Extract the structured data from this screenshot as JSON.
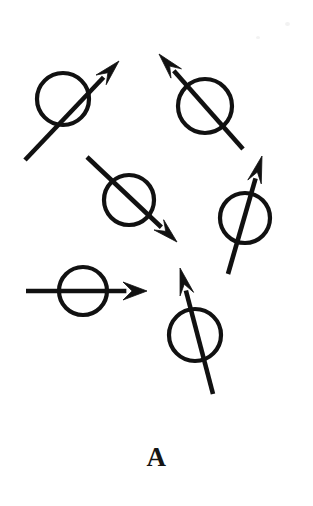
{
  "figure": {
    "title": "A",
    "panel_label": "A",
    "canvas": {
      "width": 313,
      "height": 506
    },
    "colors": {
      "background": "#ffffff",
      "ink": "#111111",
      "label": "#151515"
    },
    "style": {
      "circle_stroke_width": 4.2,
      "arrow_shaft_width": 4.6,
      "circle_fill": "none"
    },
    "spins": [
      {
        "id": "spin-top-left",
        "name": "spin-up-right-top-left",
        "circle": {
          "cx": 63,
          "cy": 99,
          "r": 26
        },
        "arrow": {
          "x1": 25,
          "y1": 160,
          "x2": 119,
          "y2": 61
        },
        "head": {
          "length": 26,
          "half_width": 7
        },
        "angle_deg": 46,
        "direction": "up-right"
      },
      {
        "id": "spin-top-right",
        "name": "spin-up-left-top-right",
        "circle": {
          "cx": 205,
          "cy": 106,
          "r": 27
        },
        "arrow": {
          "x1": 243,
          "y1": 149,
          "x2": 159,
          "y2": 54
        },
        "head": {
          "length": 26,
          "half_width": 7
        },
        "angle_deg": 131,
        "direction": "up-left"
      },
      {
        "id": "spin-middle",
        "name": "spin-down-right-middle",
        "circle": {
          "cx": 129,
          "cy": 200,
          "r": 25
        },
        "arrow": {
          "x1": 87,
          "y1": 157,
          "x2": 177,
          "y2": 242
        },
        "head": {
          "length": 25,
          "half_width": 7
        },
        "angle_deg": -43,
        "direction": "down-right"
      },
      {
        "id": "spin-right",
        "name": "spin-up-right-right",
        "circle": {
          "cx": 245,
          "cy": 218,
          "r": 25
        },
        "arrow": {
          "x1": 228,
          "y1": 274,
          "x2": 262,
          "y2": 156
        },
        "head": {
          "length": 27,
          "half_width": 7
        },
        "angle_deg": 74,
        "direction": "up-steep-right"
      },
      {
        "id": "spin-left-horizontal",
        "name": "spin-right-horizontal-left",
        "circle": {
          "cx": 83,
          "cy": 291,
          "r": 24
        },
        "arrow": {
          "x1": 26,
          "y1": 291,
          "x2": 147,
          "y2": 291
        },
        "head": {
          "length": 24,
          "half_width": 9
        },
        "angle_deg": 0,
        "direction": "right"
      },
      {
        "id": "spin-bottom",
        "name": "spin-up-left-bottom",
        "circle": {
          "cx": 195,
          "cy": 335,
          "r": 26
        },
        "arrow": {
          "x1": 213,
          "y1": 394,
          "x2": 180,
          "y2": 268
        },
        "head": {
          "length": 27,
          "half_width": 7
        },
        "angle_deg": 104,
        "direction": "up-slight-left"
      }
    ],
    "specks": [
      {
        "name": "scan-speck-top-right",
        "x": 285,
        "y": 22,
        "w": 5,
        "h": 4
      },
      {
        "name": "scan-speck-upper-right",
        "x": 256,
        "y": 36,
        "w": 4,
        "h": 3
      }
    ]
  }
}
